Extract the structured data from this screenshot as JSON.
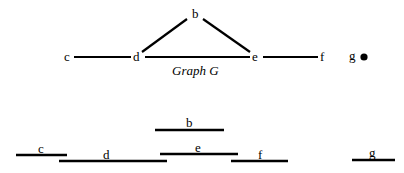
{
  "graph": {
    "caption": "Graph G",
    "vertices": [
      {
        "id": "b",
        "label": "b"
      },
      {
        "id": "c",
        "label": "c"
      },
      {
        "id": "d",
        "label": "d"
      },
      {
        "id": "e",
        "label": "e"
      },
      {
        "id": "f",
        "label": "f"
      },
      {
        "id": "g",
        "label": "g"
      }
    ],
    "edges": [
      [
        "c",
        "d"
      ],
      [
        "d",
        "b"
      ],
      [
        "b",
        "e"
      ],
      [
        "d",
        "e"
      ],
      [
        "e",
        "f"
      ]
    ],
    "isolated_vertex": "g"
  },
  "intervals": {
    "items": [
      {
        "label": "b"
      },
      {
        "label": "c"
      },
      {
        "label": "d"
      },
      {
        "label": "e"
      },
      {
        "label": "f"
      },
      {
        "label": "g"
      }
    ]
  }
}
